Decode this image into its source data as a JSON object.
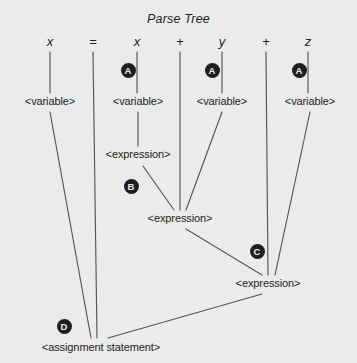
{
  "figure": {
    "title": "Parse Tree",
    "background_color": "#ebebeb",
    "line_color": "#555555",
    "text_color": "#232323",
    "badge_color": "#1e1e1e",
    "badge_text_color": "#ebebeb",
    "width": 357,
    "height": 363
  },
  "tokens": [
    {
      "text": "x",
      "kind": "identifier",
      "x": 50,
      "y": 43
    },
    {
      "text": "=",
      "kind": "operator",
      "x": 93,
      "y": 43
    },
    {
      "text": "x",
      "kind": "identifier",
      "x": 137,
      "y": 43
    },
    {
      "text": "+",
      "kind": "operator",
      "x": 180,
      "y": 43
    },
    {
      "text": "y",
      "kind": "identifier",
      "x": 222,
      "y": 43
    },
    {
      "text": "+",
      "kind": "operator",
      "x": 266,
      "y": 43
    },
    {
      "text": "z",
      "kind": "identifier",
      "x": 308,
      "y": 43
    }
  ],
  "nodes": [
    {
      "id": "var1",
      "text": "<variable>",
      "x": 50,
      "y": 103
    },
    {
      "id": "var2",
      "text": "<variable>",
      "x": 138,
      "y": 103
    },
    {
      "id": "var3",
      "text": "<variable>",
      "x": 222,
      "y": 103
    },
    {
      "id": "var4",
      "text": "<variable>",
      "x": 310,
      "y": 103
    },
    {
      "id": "expr1",
      "text": "<expression>",
      "x": 138,
      "y": 156
    },
    {
      "id": "expr2",
      "text": "<expression>",
      "x": 180,
      "y": 220
    },
    {
      "id": "expr3",
      "text": "<expression>",
      "x": 268,
      "y": 285
    },
    {
      "id": "stmt",
      "text": "<assignment statement>",
      "x": 101,
      "y": 349
    }
  ],
  "badges": [
    {
      "label": "A",
      "x": 128,
      "y": 70
    },
    {
      "label": "A",
      "x": 212,
      "y": 70
    },
    {
      "label": "A",
      "x": 299,
      "y": 70
    },
    {
      "label": "B",
      "x": 131,
      "y": 186
    },
    {
      "label": "C",
      "x": 257,
      "y": 251
    },
    {
      "label": "D",
      "x": 64,
      "y": 326
    }
  ],
  "edges": [
    {
      "from": "token-x1",
      "to": "var1",
      "x1": 50,
      "y1": 52,
      "x2": 50,
      "y2": 93
    },
    {
      "from": "token-eq",
      "to": "stmt",
      "x1": 93,
      "y1": 52,
      "x2": 97,
      "y2": 338
    },
    {
      "from": "token-x2",
      "to": "var2",
      "x1": 137,
      "y1": 52,
      "x2": 137,
      "y2": 93
    },
    {
      "from": "token-plus1",
      "to": "expr2",
      "x1": 180,
      "y1": 52,
      "x2": 180,
      "y2": 210
    },
    {
      "from": "token-y",
      "to": "var3",
      "x1": 222,
      "y1": 52,
      "x2": 222,
      "y2": 93
    },
    {
      "from": "token-plus2",
      "to": "expr3",
      "x1": 266,
      "y1": 52,
      "x2": 268,
      "y2": 275
    },
    {
      "from": "token-z",
      "to": "var4",
      "x1": 308,
      "y1": 52,
      "x2": 308,
      "y2": 93
    },
    {
      "from": "var1",
      "to": "stmt",
      "x1": 50,
      "y1": 112,
      "x2": 91,
      "y2": 338
    },
    {
      "from": "var2",
      "to": "expr1",
      "x1": 138,
      "y1": 112,
      "x2": 138,
      "y2": 146
    },
    {
      "from": "var3",
      "to": "expr2",
      "x1": 222,
      "y1": 112,
      "x2": 186,
      "y2": 210
    },
    {
      "from": "var4",
      "to": "expr3",
      "x1": 310,
      "y1": 112,
      "x2": 275,
      "y2": 275
    },
    {
      "from": "expr1",
      "to": "expr2",
      "x1": 143,
      "y1": 166,
      "x2": 174,
      "y2": 210
    },
    {
      "from": "expr2",
      "to": "expr3",
      "x1": 186,
      "y1": 229,
      "x2": 262,
      "y2": 275
    },
    {
      "from": "expr3",
      "to": "stmt",
      "x1": 262,
      "y1": 294,
      "x2": 108,
      "y2": 338
    }
  ]
}
